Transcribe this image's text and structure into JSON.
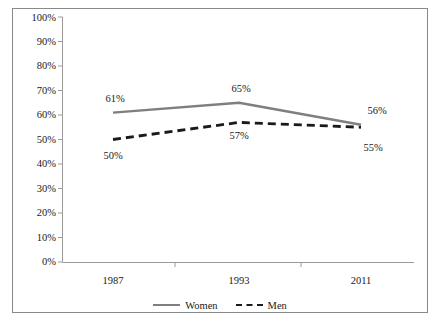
{
  "chart_data": {
    "type": "line",
    "title": "",
    "subtitle": "",
    "xlabel": "",
    "ylabel": "",
    "categories": [
      "1987",
      "1993",
      "2011"
    ],
    "ylim": [
      0,
      100
    ],
    "ytick_values": [
      100,
      90,
      80,
      70,
      60,
      50,
      40,
      30,
      20,
      10,
      0
    ],
    "ytick_labels": [
      "100%",
      "90%",
      "80%",
      "70%",
      "60%",
      "50%",
      "40%",
      "30%",
      "20%",
      "10%",
      "0%"
    ],
    "grid": false,
    "legend_position": "bottom-center",
    "series": [
      {
        "name": "Women",
        "values": [
          61,
          65,
          56
        ],
        "value_labels": [
          "61%",
          "65%",
          "56%"
        ],
        "style": "solid",
        "color": "#7f7f7f"
      },
      {
        "name": "Men",
        "values": [
          50,
          57,
          55
        ],
        "value_labels": [
          "50%",
          "57%",
          "55%"
        ],
        "style": "dashed",
        "color": "#1a1a1a"
      }
    ]
  },
  "axis": {
    "y_ticks": [
      {
        "label": "100%"
      },
      {
        "label": "90%"
      },
      {
        "label": "80%"
      },
      {
        "label": "70%"
      },
      {
        "label": "60%"
      },
      {
        "label": "50%"
      },
      {
        "label": "40%"
      },
      {
        "label": "30%"
      },
      {
        "label": "20%"
      },
      {
        "label": "10%"
      },
      {
        "label": "0%"
      }
    ],
    "x_ticks": [
      {
        "label": "1987"
      },
      {
        "label": "1993"
      },
      {
        "label": "2011"
      }
    ]
  },
  "labels": {
    "women": [
      {
        "text": "61%"
      },
      {
        "text": "65%"
      },
      {
        "text": "56%"
      }
    ],
    "men": [
      {
        "text": "50%"
      },
      {
        "text": "57%"
      },
      {
        "text": "55%"
      }
    ]
  },
  "legend": {
    "items": [
      {
        "label": "Women"
      },
      {
        "label": "Men"
      }
    ]
  },
  "colors": {
    "women_line": "#7f7f7f",
    "men_line": "#1a1a1a",
    "axis": "#9a9a9a",
    "frame": "#8a8a8a",
    "background": "#ffffff"
  }
}
